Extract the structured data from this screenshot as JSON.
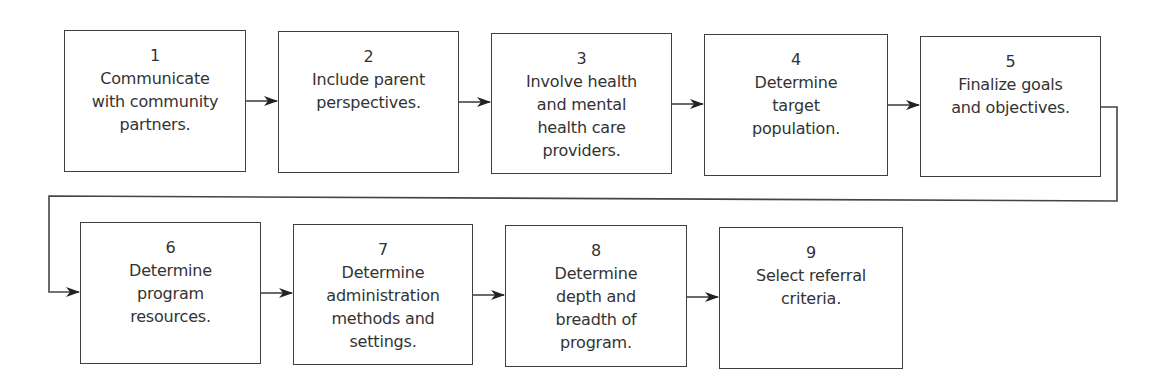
{
  "diagram": {
    "type": "process-flowchart",
    "colors": {
      "border": "#3f3f3f",
      "text": "#333333",
      "connector": "#444444",
      "arrowhead": "#222222",
      "background": "#ffffff"
    },
    "steps": [
      {
        "number": "1",
        "label": "Communicate\nwith community\npartners."
      },
      {
        "number": "2",
        "label": "Include parent\nperspectives."
      },
      {
        "number": "3",
        "label": "Involve health\nand mental\nhealth care\nproviders."
      },
      {
        "number": "4",
        "label": "Determine\ntarget\npopulation."
      },
      {
        "number": "5",
        "label": "Finalize goals\nand objectives."
      },
      {
        "number": "6",
        "label": "Determine\nprogram\nresources."
      },
      {
        "number": "7",
        "label": "Determine\nadministration\nmethods and\nsettings."
      },
      {
        "number": "8",
        "label": "Determine\ndepth and\nbreadth of\nprogram."
      },
      {
        "number": "9",
        "label": "Select referral\ncriteria."
      }
    ],
    "connections": [
      {
        "from": "1",
        "to": "2"
      },
      {
        "from": "2",
        "to": "3"
      },
      {
        "from": "3",
        "to": "4"
      },
      {
        "from": "4",
        "to": "5"
      },
      {
        "from": "5",
        "to": "6"
      },
      {
        "from": "6",
        "to": "7"
      },
      {
        "from": "7",
        "to": "8"
      },
      {
        "from": "8",
        "to": "9"
      }
    ]
  }
}
